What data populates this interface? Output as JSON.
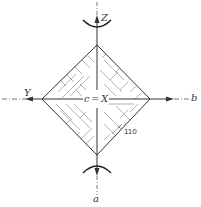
{
  "diagram": {
    "type": "crystal-face-projection",
    "shape": "diamond",
    "colors": {
      "line": "#333333",
      "hatch": "#9a9a9a",
      "background": "#ffffff"
    },
    "labels": {
      "top_axis": "Z",
      "left_axis": "Y",
      "right_axis": "b",
      "bottom_axis": "a",
      "center": "c = X",
      "face_index": "110"
    },
    "geometry": {
      "center": [
        97,
        99
      ],
      "top_vertex": [
        97,
        45
      ],
      "bottom_vertex": [
        97,
        155
      ],
      "left_vertex": [
        42,
        99
      ],
      "right_vertex": [
        150,
        99
      ]
    }
  }
}
